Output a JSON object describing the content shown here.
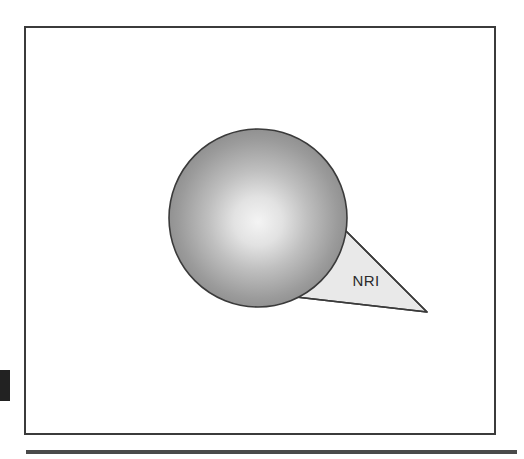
{
  "figure": {
    "title": "",
    "background_color": "#ffffff",
    "frame": {
      "name": "figure-border",
      "x": 25,
      "y": 27,
      "width": 470,
      "height": 407,
      "stroke_color": "#3b3b3b",
      "stroke_width": 2,
      "fill": "none"
    },
    "bottom_rule": {
      "name": "bottom-rule",
      "x": 26,
      "y": 450,
      "width": 491,
      "height": 4,
      "color": "#4a4a4a"
    },
    "left_marker": {
      "name": "left-edge-marker",
      "x": 0,
      "y": 370,
      "width": 10,
      "height": 31,
      "color": "#222222"
    },
    "sphere": {
      "name": "gradient-sphere",
      "center_x": 258,
      "center_y": 218,
      "radius": 89,
      "stroke_color": "#3a3a3a",
      "stroke_width": 1.6,
      "highlight_x": 258,
      "highlight_y": 222,
      "gradient_stops": [
        {
          "offset": "0%",
          "color": "#f4f4f4"
        },
        {
          "offset": "22%",
          "color": "#e2e2e2"
        },
        {
          "offset": "45%",
          "color": "#bfbfbf"
        },
        {
          "offset": "72%",
          "color": "#9b9b9b"
        },
        {
          "offset": "100%",
          "color": "#7d7d7d"
        }
      ]
    },
    "wedge": {
      "name": "nri-wedge",
      "label": "NRI",
      "label_x": 366,
      "label_y": 286,
      "fill_color": "#e9e9e9",
      "stroke_color": "#3a3a3a",
      "stroke_width": 1.6,
      "apex_top": {
        "x": 346,
        "y": 231
      },
      "apex_right": {
        "x": 427,
        "y": 312
      },
      "apex_bottom_left": {
        "x": 296,
        "y": 297
      }
    }
  }
}
